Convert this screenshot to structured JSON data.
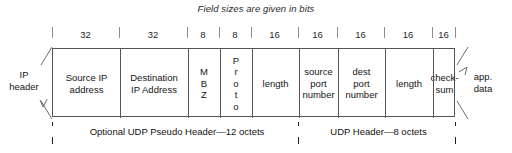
{
  "diagram": {
    "caption": "Field sizes are given in bits",
    "left_edge_label": "IP\nheader",
    "left_edge_label_line1": "IP",
    "left_edge_label_line2": "header",
    "right_edge_label_line1": "app.",
    "right_edge_label_line2": "data",
    "fields": [
      {
        "name": "source-ip-address",
        "bits": "32",
        "label_lines": [
          "Source IP",
          "address"
        ],
        "orientation": "horizontal"
      },
      {
        "name": "destination-ip-address",
        "bits": "32",
        "label_lines": [
          "Destination",
          "IP Address"
        ],
        "orientation": "horizontal"
      },
      {
        "name": "mbz",
        "bits": "8",
        "label_lines": [
          "M",
          "B",
          "Z"
        ],
        "orientation": "vertical"
      },
      {
        "name": "proto",
        "bits": "8",
        "label_lines": [
          "P",
          "r",
          "o",
          "t",
          "o"
        ],
        "orientation": "vertical"
      },
      {
        "name": "pseudo-length",
        "bits": "16",
        "label_lines": [
          "length"
        ],
        "orientation": "horizontal"
      },
      {
        "name": "source-port-number",
        "bits": "16",
        "label_lines": [
          "source",
          "port",
          "number"
        ],
        "orientation": "horizontal"
      },
      {
        "name": "dest-port-number",
        "bits": "16",
        "label_lines": [
          "dest",
          "port",
          "number"
        ],
        "orientation": "horizontal"
      },
      {
        "name": "udp-length",
        "bits": "16",
        "label_lines": [
          "length"
        ],
        "orientation": "horizontal"
      },
      {
        "name": "checksum",
        "bits": "16",
        "label_lines": [
          "check-",
          "sum"
        ],
        "orientation": "horizontal"
      }
    ],
    "spans": [
      {
        "name": "pseudo-header-span",
        "label": "Optional UDP Pseudo Header—12 octets"
      },
      {
        "name": "udp-header-span",
        "label": "UDP Header—8 octets"
      }
    ],
    "colors": {
      "background": "#ffffff",
      "line": "#555555",
      "text": "#151515",
      "tick": "#8d8d8d",
      "arrow": "#111111"
    }
  }
}
